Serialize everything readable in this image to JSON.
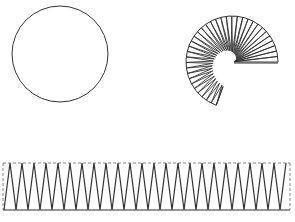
{
  "colors": {
    "background": "#ffffff",
    "stroke": "#333333",
    "dashed_stroke": "#888888"
  },
  "shapes": {
    "circle": {
      "cx": 60,
      "cy": 54,
      "r": 48
    },
    "spiral_fan": {
      "cx": 232,
      "cy": 62,
      "outer_r": 46,
      "start_deg": 0,
      "end_deg": 250,
      "segments": 36,
      "inner_r_start": 2,
      "inner_r_end": 26
    },
    "zigzag_strip": {
      "x": 3,
      "y": 163,
      "width": 287,
      "height": 47,
      "period": 12,
      "first_valley_x": 4
    }
  }
}
